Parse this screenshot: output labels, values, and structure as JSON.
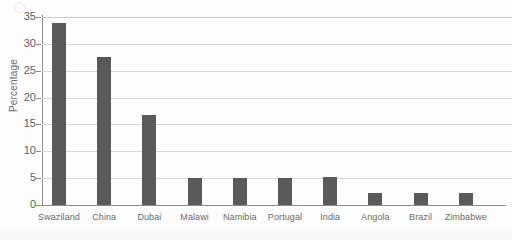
{
  "chart_data": {
    "type": "bar",
    "title": "",
    "xlabel": "",
    "ylabel": "Percentage",
    "categories": [
      "Swaziland",
      "China",
      "Dubai",
      "Malawi",
      "Namibia",
      "Portugal",
      "India",
      "Angola",
      "Brazil",
      "Zimbabwe"
    ],
    "values": [
      33.8,
      27.6,
      16.8,
      5.0,
      5.0,
      5.0,
      5.3,
      2.2,
      2.2,
      2.2
    ],
    "ylim": [
      0,
      35
    ],
    "ytick_labels": [
      "0",
      "5",
      "10",
      "15",
      "20",
      "25",
      "30",
      "35"
    ],
    "ytick_values": [
      0,
      5,
      10,
      15,
      20,
      25,
      30,
      35
    ],
    "grid": true,
    "legend": false,
    "bar_color": "#5a5a5a",
    "grid_color": "#d8d8d8",
    "axis_color": "#8c8c8c",
    "label_color": "#6b6b6b"
  }
}
